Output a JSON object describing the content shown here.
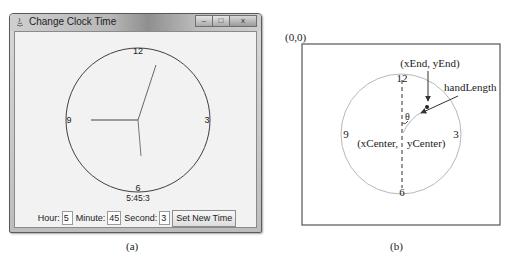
{
  "panel_a": {
    "window": {
      "title": "Change Clock Time",
      "controls": {
        "minimize": "–",
        "maximize": "□",
        "close": "x"
      }
    },
    "clock": {
      "numbers": {
        "12": "12",
        "3": "3",
        "6": "6",
        "9": "9"
      },
      "time_label": "5:45:3",
      "hour": 5,
      "minute": 45,
      "second": 3
    },
    "controls": {
      "hour_label": "Hour:",
      "hour_value": "5",
      "minute_label": "Minute:",
      "minute_value": "45",
      "second_label": "Second:",
      "second_value": "3",
      "set_button": "Set New Time"
    },
    "caption": "(a)"
  },
  "panel_b": {
    "origin_label": "(0,0)",
    "end_label": "(xEnd, yEnd)",
    "hand_length_label": "handLength",
    "theta_label": "θ",
    "center_label_x": "(xCenter,",
    "center_label_y": "yCenter)",
    "numbers": {
      "12": "12",
      "3": "3",
      "6": "6",
      "9": "9"
    },
    "caption": "(b)"
  },
  "colors": {
    "clock_circle_a": "#404040",
    "hands_a": "#555555",
    "circle_b": "#b8b8b8",
    "diagram_lines": "#333333"
  }
}
